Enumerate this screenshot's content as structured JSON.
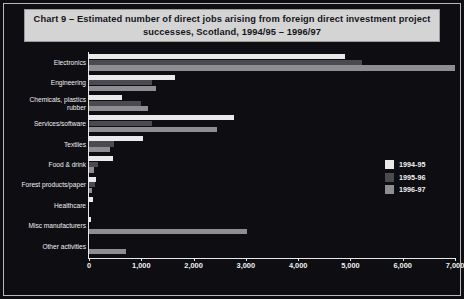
{
  "title": "Chart 9 – Estimated number of direct jobs arising from foreign direct investment project successes, Scotland, 1994/95 – 1996/97",
  "legend": {
    "items": [
      {
        "label": "1994-95",
        "color": "#e9e9e9"
      },
      {
        "label": "1995-96",
        "color": "#4a4a50"
      },
      {
        "label": "1996-97",
        "color": "#8d8d92"
      }
    ]
  },
  "axis": {
    "x_ticks": [
      "0",
      "1,000",
      "2,000",
      "3,000",
      "4,000",
      "5,000",
      "6,000",
      "7,000"
    ],
    "x_tick_values": [
      0,
      1000,
      2000,
      3000,
      4000,
      5000,
      6000,
      7000
    ]
  },
  "chart_data": {
    "type": "bar",
    "orientation": "horizontal",
    "title": "Chart 9 – Estimated number of direct jobs arising from foreign direct investment project successes, Scotland, 1994/95 – 1996/97",
    "xlabel": "",
    "ylabel": "",
    "xlim": [
      0,
      7000
    ],
    "grid": false,
    "legend_position": "right",
    "categories": [
      "Electronics",
      "Engineering",
      "Chemicals, plastics\nrubber",
      "Services/software",
      "Textiles",
      "Food & drink",
      "Forest products/paper",
      "Healthcare",
      "Misc manufacturers",
      "Other activities"
    ],
    "series": [
      {
        "name": "1994-95",
        "color": "#e9e9e9",
        "values": [
          4900,
          1650,
          630,
          2780,
          1040,
          460,
          130,
          70,
          40,
          0
        ]
      },
      {
        "name": "1995-96",
        "color": "#4a4a50",
        "values": [
          5220,
          1210,
          1000,
          1200,
          470,
          180,
          110,
          0,
          0,
          0
        ]
      },
      {
        "name": "1996-97",
        "color": "#8d8d92",
        "values": [
          7000,
          1280,
          1130,
          2450,
          400,
          100,
          60,
          0,
          3020,
          700
        ]
      }
    ]
  }
}
